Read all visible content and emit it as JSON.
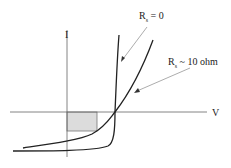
{
  "diagram": {
    "type": "iv-curve",
    "axes": {
      "x_label": "V",
      "y_label": "I"
    },
    "curves": [
      {
        "name": "Rs = 0",
        "label_main": "R",
        "label_sub": "s",
        "label_rest": " = 0"
      },
      {
        "name": "Rs ~ 10 ohm",
        "label_main": "R",
        "label_sub": "s",
        "label_rest": " ~ 10 ohm"
      }
    ],
    "shaded_region": "max power rectangle",
    "colors": {
      "line": "#222222",
      "axis": "#555555",
      "arrow": "#777777",
      "shade": "#d9d9d9"
    }
  }
}
